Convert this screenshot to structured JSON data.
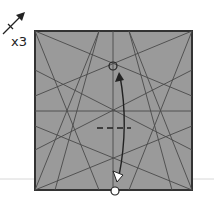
{
  "diagram": {
    "type": "origami-step",
    "repeat_label": "x3",
    "repeat_icon": "repeat-arrow-icon",
    "colors": {
      "paper_fill": "#9a9a9a",
      "paper_border": "#333333",
      "crease_line": "#4a4a4a",
      "arrow": "#222222",
      "baseline": "#d8d8d8",
      "background": "#ffffff"
    },
    "square": {
      "x": 35,
      "y": 31,
      "width": 157,
      "height": 159
    },
    "annotations": {
      "top_point_marker": "circle",
      "bottom_point_marker": "circle",
      "fold_arrow": "valley-fold-and-unfold",
      "fold_line": "dashed"
    }
  }
}
